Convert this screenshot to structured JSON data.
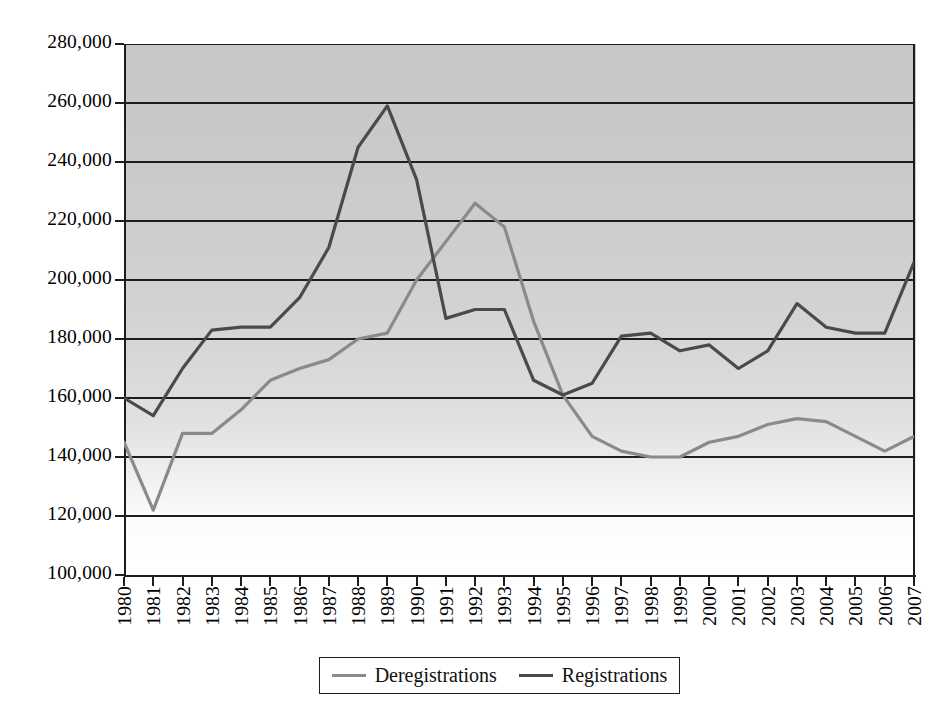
{
  "chart_data": {
    "type": "line",
    "title": "",
    "xlabel": "",
    "ylabel": "",
    "grid": true,
    "legend_position": "bottom",
    "ylim": [
      100000,
      280000
    ],
    "ytick_step": 20000,
    "ytick_labels": [
      "280,000",
      "260,000",
      "240,000",
      "220,000",
      "200,000",
      "180,000",
      "160,000",
      "140,000",
      "120,000",
      "100,000"
    ],
    "ytick_values": [
      280000,
      260000,
      240000,
      220000,
      200000,
      180000,
      160000,
      140000,
      120000,
      100000
    ],
    "categories": [
      "1980",
      "1981",
      "1982",
      "1983",
      "1984",
      "1985",
      "1986",
      "1987",
      "1988",
      "1989",
      "1990",
      "1991",
      "1992",
      "1993",
      "1994",
      "1995",
      "1996",
      "1997",
      "1998",
      "1999",
      "2000",
      "2001",
      "2002",
      "2003",
      "2004",
      "2005",
      "2006",
      "2007"
    ],
    "x": [
      1980,
      1981,
      1982,
      1983,
      1984,
      1985,
      1986,
      1987,
      1988,
      1989,
      1990,
      1991,
      1992,
      1993,
      1994,
      1995,
      1996,
      1997,
      1998,
      1999,
      2000,
      2001,
      2002,
      2003,
      2004,
      2005,
      2006,
      2007
    ],
    "series": [
      {
        "name": "Deregistrations",
        "color": "#8a8a8a",
        "values": [
          145000,
          122000,
          148000,
          148000,
          156000,
          166000,
          170000,
          173000,
          180000,
          182000,
          200000,
          213000,
          226000,
          218000,
          186000,
          161000,
          147000,
          142000,
          140000,
          140000,
          145000,
          147000,
          151000,
          153000,
          152000,
          147000,
          142000,
          147000
        ]
      },
      {
        "name": "Registrations",
        "color": "#4a4a4a",
        "values": [
          160000,
          154000,
          170000,
          183000,
          184000,
          184000,
          194000,
          211000,
          245000,
          259000,
          234000,
          187000,
          190000,
          190000,
          166000,
          161000,
          165000,
          181000,
          182000,
          176000,
          178000,
          170000,
          176000,
          192000,
          184000,
          182000,
          182000,
          206000
        ]
      }
    ]
  },
  "legend": {
    "entries": [
      {
        "label": "Deregistrations",
        "color": "#8a8a8a"
      },
      {
        "label": "Registrations",
        "color": "#4a4a4a"
      }
    ]
  }
}
